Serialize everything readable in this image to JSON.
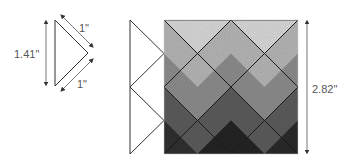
{
  "diagram": {
    "single_triangle": {
      "hypotenuse_label": "1.41\"",
      "upper_leg_label": "1\"",
      "lower_leg_label": "1\""
    },
    "quilt_block": {
      "side_label": "2.82\"",
      "rows": [
        {
          "shade": "#d2d2d2"
        },
        {
          "shade": "#a8a8a8"
        },
        {
          "shade": "#7a7a7a"
        },
        {
          "shade": "#505050"
        },
        {
          "shade": "#2a2a2a"
        }
      ]
    },
    "colors": {
      "line": "#222222",
      "dimension": "#444444",
      "label": "#555555"
    }
  }
}
